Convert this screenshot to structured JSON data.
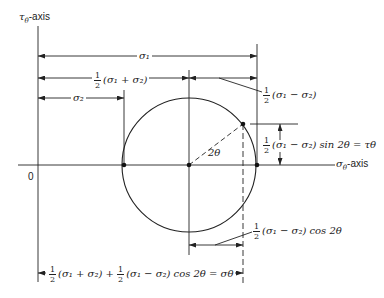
{
  "diagram": {
    "axes": {
      "vertical_label_sym": "τ",
      "vertical_label_sub": "θ",
      "vertical_label_suffix": "-axis",
      "horizontal_label_sym": "σ",
      "horizontal_label_sub": "θ",
      "horizontal_label_suffix": "-axis",
      "origin_label": "0"
    },
    "dimensions": {
      "sigma1": "σ₁",
      "half_sum": "(σ₁ + σ₂)",
      "sigma2": "σ₂",
      "half_diff": "(σ₁ − σ₂)",
      "shear": "(σ₁ − σ₂) sin 2θ = τθ",
      "cos_term": "(σ₁ − σ₂) cos 2θ",
      "normal_prefix": "(σ₁ + σ₂) +",
      "normal_suffix": "(σ₁ − σ₂) cos 2θ = σθ"
    },
    "fraction": {
      "num": "1",
      "den": "2"
    },
    "angle_label": "2θ",
    "geometry": {
      "tau_axis_x": 38,
      "sigma_axis_y": 165,
      "center": [
        189,
        165
      ],
      "radius": 67,
      "point_on_circle": [
        243,
        124
      ]
    }
  }
}
